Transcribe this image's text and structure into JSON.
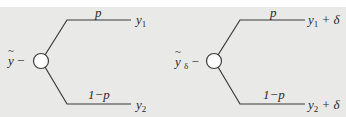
{
  "colors": {
    "background": "#e9e9e8",
    "line": "#3a3a3a",
    "node_fill": "#ffffff",
    "text": "#2a2a2a"
  },
  "diagrams": [
    {
      "name": "lottery",
      "root_label": {
        "var": "y",
        "tilde": "~",
        "sub": "",
        "dash": "−"
      },
      "branches": [
        {
          "prob": "p",
          "outcome_var": "y",
          "outcome_sub": "1",
          "outcome_suffix": ""
        },
        {
          "prob": "1−p",
          "outcome_var": "y",
          "outcome_sub": "2",
          "outcome_suffix": ""
        }
      ]
    },
    {
      "name": "shifted-lottery",
      "root_label": {
        "var": "y",
        "tilde": "~",
        "sub": "δ",
        "dash": "−"
      },
      "branches": [
        {
          "prob": "p",
          "outcome_var": "y",
          "outcome_sub": "1",
          "outcome_suffix": " + δ"
        },
        {
          "prob": "1−p",
          "outcome_var": "y",
          "outcome_sub": "2",
          "outcome_suffix": " + δ"
        }
      ]
    }
  ]
}
